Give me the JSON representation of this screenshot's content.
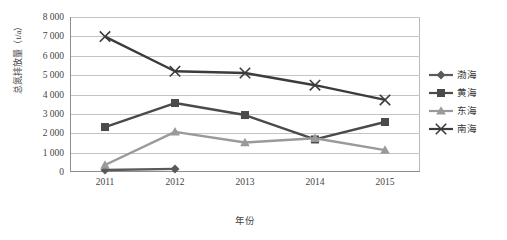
{
  "chart_data": {
    "type": "line",
    "title": "",
    "xlabel": "年份",
    "ylabel": "总氮排放量（t/a）",
    "categories": [
      "2011",
      "2012",
      "2013",
      "2014",
      "2015"
    ],
    "x_tick_labels": [
      "2011",
      "2012",
      "2013",
      "2014",
      "2015"
    ],
    "y_tick_labels": [
      "8 000",
      "7 000",
      "6 000",
      "5 000",
      "4 000",
      "3 000",
      "2 000",
      "1 000",
      "0"
    ],
    "y_tick_values": [
      8000,
      7000,
      6000,
      5000,
      4000,
      3000,
      2000,
      1000,
      0
    ],
    "ylim": [
      0,
      8000
    ],
    "grid": "horizontal",
    "legend_position": "right",
    "series": [
      {
        "name": "渤海",
        "marker": "diamond",
        "color": "#595959",
        "values": [
          100,
          160,
          null,
          null,
          null
        ]
      },
      {
        "name": "黄海",
        "marker": "square",
        "color": "#4a4a4a",
        "values": [
          2320,
          3560,
          2940,
          1680,
          2580
        ]
      },
      {
        "name": "东海",
        "marker": "triangle",
        "color": "#9a9a9a",
        "values": [
          360,
          2070,
          1520,
          1740,
          1130
        ]
      },
      {
        "name": "南海",
        "marker": "x",
        "color": "#3c3c3c",
        "values": [
          6990,
          5200,
          5110,
          4480,
          3720
        ]
      }
    ]
  },
  "legend": {
    "items": [
      {
        "label": "渤海"
      },
      {
        "label": "黄海"
      },
      {
        "label": "东海"
      },
      {
        "label": "南海"
      }
    ]
  },
  "colors": {
    "bohai": "#595959",
    "huanghai": "#4a4a4a",
    "donghai": "#9a9a9a",
    "nanhai": "#3c3c3c",
    "gridline": "#c4c4c4",
    "axis": "#8d8d8d",
    "text": "#3a3a3a",
    "background": "#ffffff"
  }
}
